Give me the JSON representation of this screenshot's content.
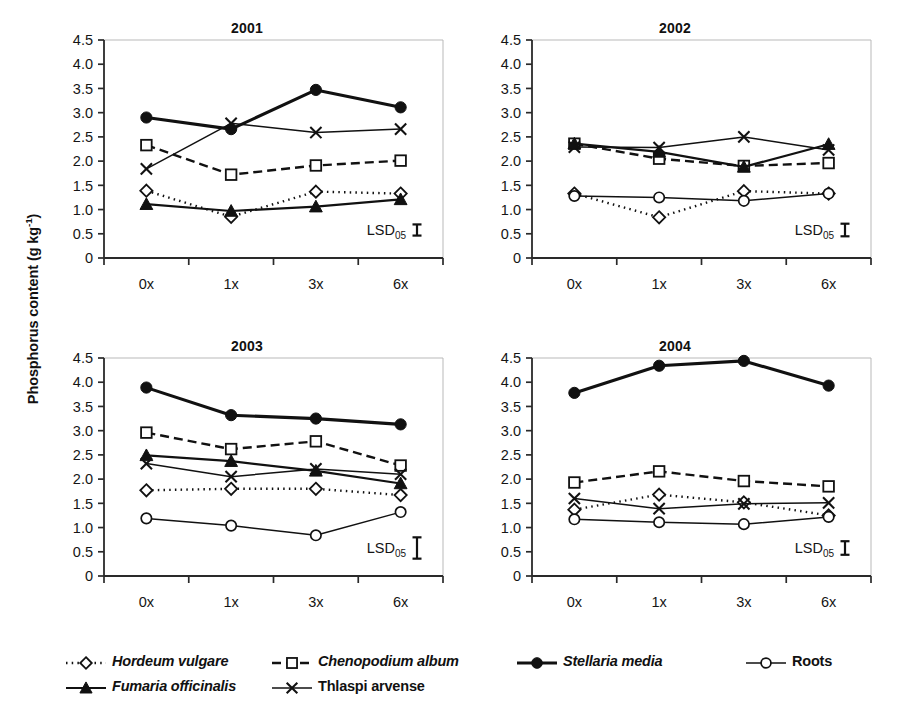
{
  "axis": {
    "ylabel": "Phosphorus content (g kg",
    "ylabel_sup": "-1",
    "ylabel_close": ")",
    "ytick_labels": [
      "4.5",
      "4.0",
      "3.5",
      "3.0",
      "2.5",
      "2.0",
      "1.5",
      "1.0",
      "0.5",
      "0"
    ],
    "ytick_values": [
      4.5,
      4.0,
      3.5,
      3.0,
      2.5,
      2.0,
      1.5,
      1.0,
      0.5,
      0
    ],
    "xtick_labels": [
      "0x",
      "1x",
      "3x",
      "6x"
    ],
    "ylim": [
      0,
      4.5
    ]
  },
  "lsd": {
    "label": "LSD",
    "subscript": "05"
  },
  "legend": {
    "items": [
      {
        "label": "Hordeum vulgare",
        "marker": "open-diamond",
        "line": "dotted",
        "italic": true
      },
      {
        "label": "Chenopodium album",
        "marker": "open-square",
        "line": "dashdot",
        "italic": true
      },
      {
        "label": "Stellaria media",
        "marker": "filled-circle",
        "line": "solid-thick",
        "italic": true
      },
      {
        "label": "Roots",
        "marker": "open-circle",
        "line": "solid-thin",
        "italic": false
      },
      {
        "label": "Fumaria officinalis",
        "marker": "filled-triangle",
        "line": "solid-med",
        "italic": true
      },
      {
        "label": "Thlaspi arvense",
        "marker": "cross",
        "line": "solid-thin",
        "italic": false
      }
    ]
  },
  "chart_data": {
    "type": "line",
    "title": "",
    "xlabel": "",
    "ylabel": "Phosphorus content (g kg-1)",
    "ylim": [
      0,
      4.5
    ],
    "grid": false,
    "legend_position": "bottom",
    "categories": [
      "0x",
      "1x",
      "3x",
      "6x"
    ],
    "panels": [
      {
        "title": "2001",
        "lsd_value": 0.23,
        "series": [
          {
            "name": "Hordeum vulgare",
            "marker": "open-diamond",
            "line": "dotted",
            "values": [
              1.39,
              0.85,
              1.37,
              1.33
            ]
          },
          {
            "name": "Chenopodium album",
            "marker": "open-square",
            "line": "dashdot",
            "values": [
              2.33,
              1.72,
              1.91,
              2.01
            ]
          },
          {
            "name": "Stellaria media",
            "marker": "filled-circle",
            "line": "solid-thick",
            "values": [
              2.9,
              2.66,
              3.47,
              3.11
            ]
          },
          {
            "name": "Roots",
            "marker": "open-circle",
            "line": "solid-thin",
            "values": [
              null,
              null,
              null,
              null
            ]
          },
          {
            "name": "Fumaria officinalis",
            "marker": "filled-triangle",
            "line": "solid-med",
            "values": [
              1.11,
              0.97,
              1.06,
              1.21
            ]
          },
          {
            "name": "Thlaspi arvense",
            "marker": "cross",
            "line": "solid-thin",
            "values": [
              1.84,
              2.78,
              2.59,
              2.66
            ]
          }
        ]
      },
      {
        "title": "2002",
        "lsd_value": 0.26,
        "series": [
          {
            "name": "Hordeum vulgare",
            "marker": "open-diamond",
            "line": "dotted",
            "values": [
              1.33,
              0.84,
              1.38,
              1.33
            ]
          },
          {
            "name": "Chenopodium album",
            "marker": "open-square",
            "line": "dashdot",
            "values": [
              2.36,
              2.05,
              1.9,
              1.96
            ]
          },
          {
            "name": "Stellaria media",
            "marker": "filled-circle",
            "line": "solid-thick",
            "values": [
              null,
              null,
              null,
              null
            ]
          },
          {
            "name": "Roots",
            "marker": "open-circle",
            "line": "solid-thin",
            "values": [
              1.28,
              1.25,
              1.18,
              1.33
            ]
          },
          {
            "name": "Fumaria officinalis",
            "marker": "filled-triangle",
            "line": "solid-med",
            "values": [
              2.36,
              2.19,
              1.88,
              2.35
            ]
          },
          {
            "name": "Thlaspi arvense",
            "marker": "cross",
            "line": "solid-thin",
            "values": [
              2.29,
              2.28,
              2.5,
              2.23
            ]
          }
        ]
      },
      {
        "title": "2003",
        "lsd_value": 0.44,
        "series": [
          {
            "name": "Hordeum vulgare",
            "marker": "open-diamond",
            "line": "dotted",
            "values": [
              1.77,
              1.8,
              1.8,
              1.67
            ]
          },
          {
            "name": "Chenopodium album",
            "marker": "open-square",
            "line": "dashdot",
            "values": [
              2.96,
              2.62,
              2.78,
              2.28
            ]
          },
          {
            "name": "Stellaria media",
            "marker": "filled-circle",
            "line": "solid-thick",
            "values": [
              3.89,
              3.32,
              3.25,
              3.13
            ]
          },
          {
            "name": "Roots",
            "marker": "open-circle",
            "line": "solid-thin",
            "values": [
              1.19,
              1.04,
              0.84,
              1.32
            ]
          },
          {
            "name": "Fumaria officinalis",
            "marker": "filled-triangle",
            "line": "solid-med",
            "values": [
              2.49,
              2.37,
              2.17,
              1.91
            ]
          },
          {
            "name": "Thlaspi arvense",
            "marker": "cross",
            "line": "solid-thin",
            "values": [
              2.32,
              2.05,
              2.21,
              2.1
            ]
          }
        ]
      },
      {
        "title": "2004",
        "lsd_value": 0.28,
        "series": [
          {
            "name": "Hordeum vulgare",
            "marker": "open-diamond",
            "line": "dotted",
            "values": [
              1.37,
              1.68,
              1.52,
              1.25
            ]
          },
          {
            "name": "Chenopodium album",
            "marker": "open-square",
            "line": "dashdot",
            "values": [
              1.93,
              2.16,
              1.96,
              1.85
            ]
          },
          {
            "name": "Stellaria media",
            "marker": "filled-circle",
            "line": "solid-thick",
            "values": [
              3.78,
              4.34,
              4.44,
              3.93
            ]
          },
          {
            "name": "Roots",
            "marker": "open-circle",
            "line": "solid-thin",
            "values": [
              1.17,
              1.11,
              1.07,
              1.22
            ]
          },
          {
            "name": "Fumaria officinalis",
            "marker": "filled-triangle",
            "line": "solid-med",
            "values": [
              null,
              null,
              null,
              null
            ]
          },
          {
            "name": "Thlaspi arvense",
            "marker": "cross",
            "line": "solid-thin",
            "values": [
              1.6,
              1.39,
              1.49,
              1.51
            ]
          }
        ]
      }
    ]
  }
}
